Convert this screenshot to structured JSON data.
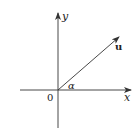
{
  "figure": {
    "type": "coordinate-axes-with-vector",
    "labels": {
      "y_axis": "y",
      "x_axis": "x",
      "origin": "0",
      "vector": "u",
      "angle": "α"
    },
    "geometry": {
      "origin": [
        58,
        90
      ],
      "x_axis": {
        "from": [
          20,
          90
        ],
        "to": [
          131,
          90
        ]
      },
      "y_axis": {
        "from": [
          58,
          128
        ],
        "to": [
          58,
          13
        ]
      },
      "vector": {
        "from": [
          58,
          90
        ],
        "to": [
          119,
          37
        ]
      }
    },
    "colors": {
      "stroke": "#333333",
      "text": "#222222",
      "background": "#ffffff"
    }
  }
}
